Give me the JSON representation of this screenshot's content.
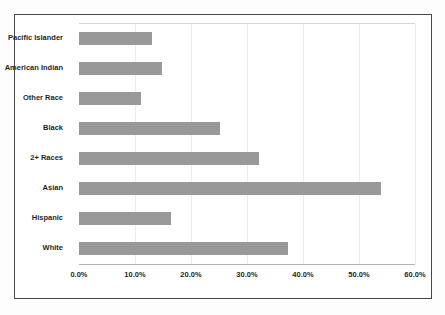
{
  "chart_data": {
    "type": "bar",
    "orientation": "horizontal",
    "title": "",
    "categories": [
      "Pacific Islander",
      "American Indian",
      "Other Race",
      "Black",
      "2+ Races",
      "Asian",
      "Hispanic",
      "White"
    ],
    "values": [
      13.0,
      14.8,
      11.0,
      25.2,
      32.2,
      54.0,
      16.4,
      37.3
    ],
    "x_tick_labels": [
      "0.0%",
      "10.0%",
      "20.0%",
      "30.0%",
      "40.0%",
      "50.0%",
      "60.0%"
    ],
    "xlim": [
      0,
      60
    ],
    "xlabel": "",
    "ylabel": "",
    "grid": true,
    "legend": "none",
    "bar_color": "#999999",
    "gridline_color": "#ececec",
    "frame_border_color": "#474747",
    "axis_line_color": "#b3b3b3"
  }
}
